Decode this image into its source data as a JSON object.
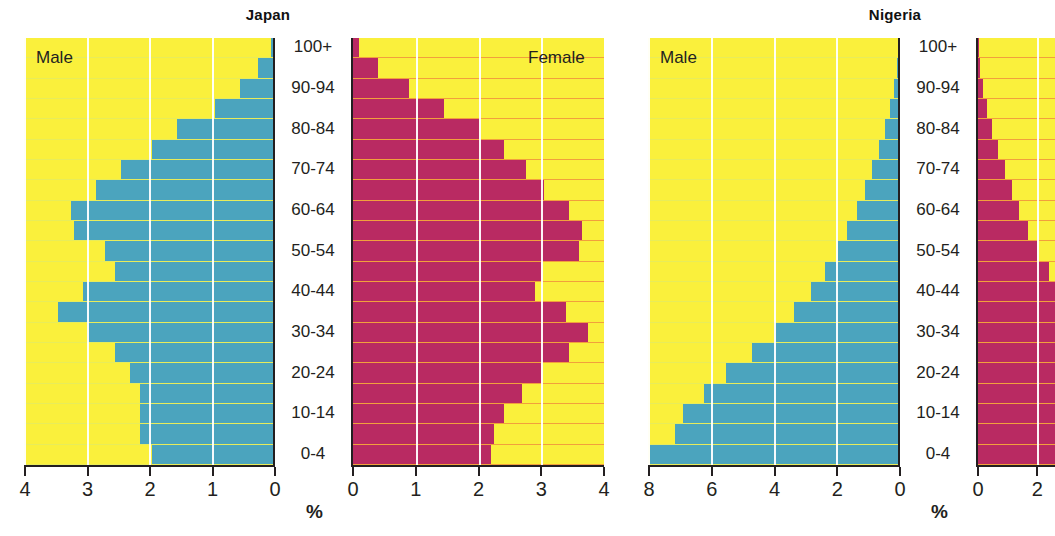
{
  "page": {
    "background": "#ffffff",
    "male_color": "#4ba4be",
    "female_color": "#b92a62",
    "panel_background": "#faf03c",
    "axis_color": "#231f20",
    "male_gridline_color": "#e8ec5a",
    "female_gridline_color": "#f2a03c"
  },
  "panels": {
    "japan": {
      "title": "Japan",
      "male_label": "Male",
      "female_label": "Female",
      "percent_label": "%",
      "male_ticks": [
        "4",
        "3",
        "2",
        "1",
        "0"
      ],
      "female_ticks": [
        "0",
        "1",
        "2",
        "3",
        "4"
      ],
      "caption": ""
    },
    "nigeria": {
      "title": "Nigeria",
      "male_label": "Male",
      "female_label": "Female",
      "percent_label": "%",
      "male_ticks": [
        "8",
        "6",
        "4",
        "2",
        "0"
      ],
      "female_ticks": [
        "0",
        "2"
      ],
      "caption": ""
    }
  },
  "age_groups": [
    "100+",
    "95-99",
    "90-94",
    "85-89",
    "80-84",
    "75-79",
    "70-74",
    "65-69",
    "60-64",
    "55-59",
    "50-54",
    "45-49",
    "40-44",
    "35-39",
    "30-34",
    "25-29",
    "20-24",
    "15-19",
    "10-14",
    "5-9",
    "0-4"
  ],
  "age_labels_shown": [
    "100+",
    "",
    "90-94",
    "",
    "80-84",
    "",
    "70-74",
    "",
    "60-64",
    "",
    "50-54",
    "",
    "40-44",
    "",
    "30-34",
    "",
    "20-24",
    "",
    "10-14",
    "",
    "0-4"
  ],
  "chart_data": [
    {
      "type": "bar",
      "title": "Japan",
      "subtitle": "Population pyramid",
      "xlabel": "%",
      "ylabel": "Age group",
      "orientation": "horizontal-diverging",
      "categories": [
        "100+",
        "95-99",
        "90-94",
        "85-89",
        "80-84",
        "75-79",
        "70-74",
        "65-69",
        "60-64",
        "55-59",
        "50-54",
        "45-49",
        "40-44",
        "35-39",
        "30-34",
        "25-29",
        "20-24",
        "15-19",
        "10-14",
        "5-9",
        "0-4"
      ],
      "series": [
        {
          "name": "Male",
          "axis": "left",
          "xlim": [
            4,
            0
          ],
          "xticks": [
            4,
            3,
            2,
            1,
            0
          ],
          "values": [
            0.05,
            0.25,
            0.55,
            0.95,
            1.55,
            1.95,
            2.45,
            2.85,
            3.25,
            3.2,
            2.7,
            2.55,
            3.05,
            3.45,
            3.0,
            2.55,
            2.3,
            2.15,
            2.15,
            2.15,
            1.95
          ]
        },
        {
          "name": "Female",
          "axis": "right",
          "xlim": [
            0,
            4
          ],
          "xticks": [
            0,
            1,
            2,
            3,
            4
          ],
          "values": [
            0.1,
            0.4,
            0.9,
            1.45,
            2.0,
            2.4,
            2.75,
            3.05,
            3.45,
            3.65,
            3.6,
            3.0,
            2.9,
            3.4,
            3.75,
            3.45,
            3.0,
            2.7,
            2.4,
            2.25,
            2.2
          ]
        }
      ],
      "grid": true,
      "legend": [
        "Male",
        "Female"
      ],
      "legend_position": "inside-top"
    },
    {
      "type": "bar",
      "title": "Nigeria",
      "subtitle": "Population pyramid",
      "xlabel": "%",
      "ylabel": "Age group",
      "orientation": "horizontal-diverging",
      "categories": [
        "100+",
        "95-99",
        "90-94",
        "85-89",
        "80-84",
        "75-79",
        "70-74",
        "65-69",
        "60-64",
        "55-59",
        "50-54",
        "45-49",
        "40-44",
        "35-39",
        "30-34",
        "25-29",
        "20-24",
        "15-19",
        "10-14",
        "5-9",
        "0-4"
      ],
      "series": [
        {
          "name": "Male",
          "axis": "left",
          "xlim": [
            8,
            0
          ],
          "xticks": [
            8,
            6,
            4,
            2,
            0
          ],
          "values": [
            0.02,
            0.05,
            0.15,
            0.3,
            0.45,
            0.65,
            0.85,
            1.1,
            1.35,
            1.65,
            1.95,
            2.35,
            2.8,
            3.35,
            4.0,
            4.7,
            5.5,
            6.2,
            6.9,
            7.15,
            7.95
          ]
        },
        {
          "name": "Female",
          "axis": "right",
          "xlim": [
            0,
            2.6
          ],
          "xticks": [
            0,
            2
          ],
          "values": [
            0.02,
            0.06,
            0.16,
            0.32,
            0.48,
            0.68,
            0.9,
            1.15,
            1.4,
            1.7,
            2.0,
            2.4,
            2.6,
            2.6,
            2.6,
            2.6,
            2.6,
            2.6,
            2.6,
            2.6,
            2.6
          ]
        }
      ],
      "grid": true,
      "legend": [
        "Male",
        "Female"
      ],
      "legend_position": "inside-top"
    }
  ]
}
